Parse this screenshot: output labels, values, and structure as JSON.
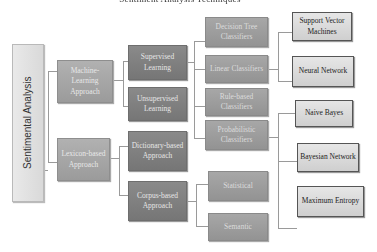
{
  "title": "Sentiment Analysis Techniques",
  "root": {
    "label": "Sentimental Analysis"
  },
  "level1": [
    {
      "label": "Machine-Learning Approach"
    },
    {
      "label": "Lexicon-based Approach"
    }
  ],
  "level2": [
    {
      "label": "Supervised Learning"
    },
    {
      "label": "Unsupervised Learning"
    },
    {
      "label": "Dictionary-based Approach"
    },
    {
      "label": "Corpus-based Approach"
    }
  ],
  "level3": [
    {
      "label": "Decision Tree Classifiers"
    },
    {
      "label": "Linear Classifiers"
    },
    {
      "label": "Rule-based Classifiers"
    },
    {
      "label": "Probabilistic Classifiers"
    },
    {
      "label": "Statistical"
    },
    {
      "label": "Semantic"
    }
  ],
  "leaves": [
    {
      "label": "Support Vector Machines"
    },
    {
      "label": "Neural Network"
    },
    {
      "label": "Naive Bayes"
    },
    {
      "label": "Bayesian Network"
    },
    {
      "label": "Maximum Entropy"
    }
  ],
  "colors": {
    "root": "#e0e0e0",
    "level1": "#a6a6a6",
    "level2": "#808080",
    "level3": "#9d9d9d",
    "leaf": "#dadada",
    "connector": "#9a9a9a"
  }
}
